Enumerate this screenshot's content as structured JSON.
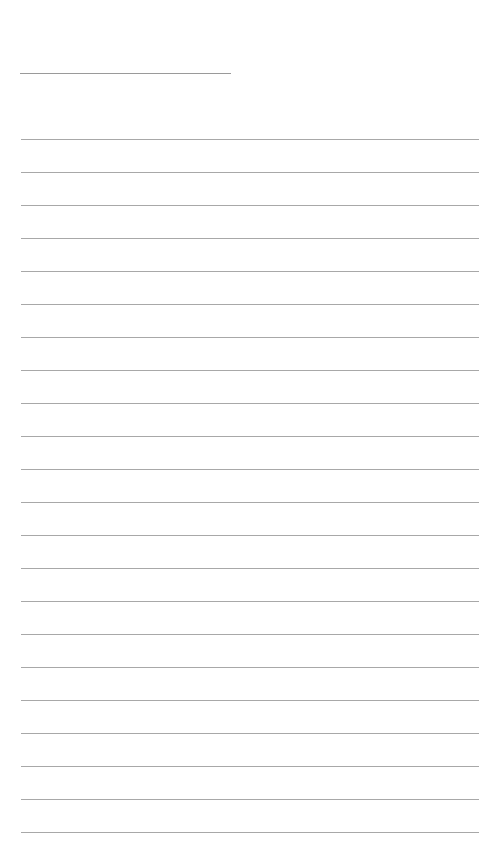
{
  "page": {
    "type": "lined-notepaper",
    "background_color": "#ffffff",
    "line_color": "#a8a8a8",
    "title_line": {
      "present": true
    },
    "ruled_lines": {
      "count": 22,
      "spacing_px": 33
    }
  }
}
